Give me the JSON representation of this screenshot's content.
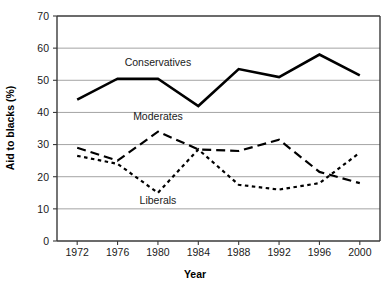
{
  "chart_data": {
    "type": "line",
    "title": "",
    "xlabel": "Year",
    "ylabel": "Aid to blacks (%)",
    "x": [
      1972,
      1976,
      1980,
      1984,
      1988,
      1992,
      1996,
      2000
    ],
    "xticklabels": [
      "1972",
      "1976",
      "1980",
      "1984",
      "1988",
      "1992",
      "1996",
      "2000"
    ],
    "yticklabels": [
      "0",
      "10",
      "20",
      "30",
      "40",
      "50",
      "60",
      "70"
    ],
    "yticks": [
      0,
      10,
      20,
      30,
      40,
      50,
      60,
      70
    ],
    "ylim": [
      0,
      70
    ],
    "grid": "horizontal",
    "legend": "inline-annotations",
    "series": [
      {
        "name": "Conservatives",
        "style": "solid",
        "color": "#000000",
        "values": [
          44,
          50.5,
          50.5,
          42,
          53.5,
          51,
          58,
          51.5
        ],
        "label_x": 1980,
        "label_y": 54.5
      },
      {
        "name": "Moderates",
        "style": "dashed",
        "color": "#000000",
        "values": [
          29,
          25,
          34,
          28.5,
          28,
          31.5,
          21.5,
          18
        ],
        "label_x": 1980,
        "label_y": 37.5
      },
      {
        "name": "Liberals",
        "style": "dotted",
        "color": "#000000",
        "values": [
          26.5,
          24,
          15,
          28.5,
          17.5,
          16,
          18,
          27.5
        ],
        "label_x": 1980,
        "label_y": 11.5
      }
    ]
  },
  "axes": {
    "y_title": "Aid to blacks (%)",
    "x_title": "Year"
  }
}
